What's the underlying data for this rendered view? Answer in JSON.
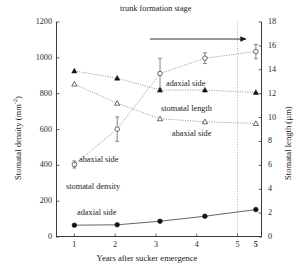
{
  "chart_data": {
    "type": "line",
    "title": "",
    "xlabel": "Years after sucker emergence",
    "ylabel_left": "Stomatal density (mm-2)",
    "ylabel_right": "Stomatal length (µm)",
    "xlim": [
      0.55,
      5.6
    ],
    "ylim_left": [
      0,
      1200
    ],
    "ylim_right": [
      0,
      18
    ],
    "xticks": [
      "1",
      "2",
      "3",
      "4",
      "5",
      "5"
    ],
    "xtick_values": [
      1,
      2,
      3,
      4,
      5,
      5.45
    ],
    "xtick_bold_index": 5,
    "yticks_left": [
      "0",
      "200",
      "400",
      "600",
      "800",
      "1000",
      "1200"
    ],
    "ytick_values_left": [
      0,
      200,
      400,
      600,
      800,
      1000,
      1200
    ],
    "yticks_right": [
      "0",
      "2",
      "4",
      "6",
      "8",
      "10",
      "12",
      "14",
      "16",
      "18"
    ],
    "ytick_values_right": [
      0,
      2,
      4,
      6,
      8,
      10,
      12,
      14,
      16,
      18
    ],
    "grid": false,
    "legend_position": "inline-annotations",
    "annotations": [
      {
        "text": "trunk formation stage",
        "x": 3.5,
        "y": 1180,
        "name": "trunk-formation-stage-label"
      },
      {
        "text": "adaxial side",
        "x": 3.6,
        "y": 880,
        "name": "adaxial-side-length-label"
      },
      {
        "text": "stomatal length",
        "x": 3.5,
        "y": 740,
        "name": "stomatal-length-group-label"
      },
      {
        "text": "abaxial side",
        "x": 3.7,
        "y": 600,
        "name": "abaxial-side-length-label"
      },
      {
        "text": "abaxial side",
        "x": 1.5,
        "y": 455,
        "name": "abaxial-side-density-label"
      },
      {
        "text": "stomatal density",
        "x": 1.35,
        "y": 310,
        "name": "stomatal-density-group-label"
      },
      {
        "text": "adaxial side",
        "x": 1.5,
        "y": 170,
        "name": "adaxial-side-density-label"
      }
    ],
    "arrow": {
      "x_start": 2.85,
      "x_end": 5.2,
      "y": 1105,
      "direction": "right",
      "name": "trunk-formation-arrow"
    },
    "vline": {
      "x": 5.0,
      "style": "dotted",
      "name": "trunk-formation-divider"
    },
    "series": [
      {
        "name": "stomatal density, abaxial side",
        "axis": "left",
        "marker": "open-circle",
        "linestyle": "dotted",
        "x": [
          1.0,
          2.05,
          3.1,
          4.2,
          5.45
        ],
        "values": [
          405,
          602,
          912,
          998,
          1035
        ],
        "errors": [
          20,
          68,
          85,
          30,
          40
        ]
      },
      {
        "name": "stomatal density, adaxial side",
        "axis": "left",
        "marker": "filled-circle",
        "linestyle": "solid",
        "x": [
          1.0,
          2.05,
          3.1,
          4.2,
          5.45
        ],
        "values": [
          66,
          68,
          88,
          116,
          153
        ],
        "errors": [
          0,
          0,
          0,
          0,
          0
        ]
      },
      {
        "name": "stomatal length, adaxial side",
        "axis": "right",
        "marker": "filled-triangle",
        "linestyle": "dotted",
        "x": [
          1.0,
          2.05,
          3.1,
          4.2,
          5.45
        ],
        "values": [
          13.9,
          13.3,
          12.3,
          12.3,
          12.1
        ],
        "errors": [
          0,
          0,
          0,
          0,
          0
        ]
      },
      {
        "name": "stomatal length, abaxial side",
        "axis": "right",
        "marker": "open-triangle",
        "linestyle": "dotted",
        "x": [
          1.0,
          2.05,
          3.1,
          4.2,
          5.45
        ],
        "values": [
          12.8,
          11.2,
          9.9,
          9.65,
          9.5
        ],
        "errors": [
          0,
          0,
          0,
          0,
          0
        ]
      }
    ]
  },
  "axes": {
    "left_title_main": "Stomatal density (mm",
    "left_title_sup": "-2",
    "left_title_end": ")",
    "right_title": "Stomatal length (µm)",
    "x_title": "Years after sucker emergence"
  },
  "colors": {
    "axis": "#3a3a3a",
    "text": "#1a1a1a",
    "marker_fill": "#111111",
    "marker_open": "#ffffff",
    "line_solid": "#555555",
    "line_dotted": "#777777"
  }
}
